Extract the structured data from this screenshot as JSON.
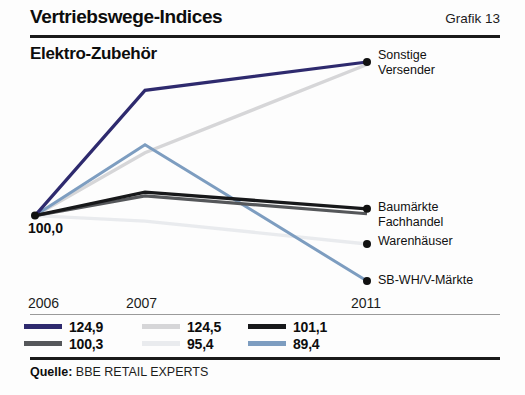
{
  "header": {
    "title": "Vertriebswege-Indices",
    "figure_number": "Grafik 13",
    "subtitle": "Elektro-Zubehör"
  },
  "footer": {
    "source_label": "Quelle:",
    "source_value": "BBE RETAIL EXPERTS"
  },
  "baseline_label": "100,0",
  "series_labels": {
    "sonstige_line1": "Sonstige",
    "sonstige_line2": "Versender",
    "baumaerkte": "Baumärkte",
    "fachhandel": "Fachhandel",
    "warenhaeuser": "Warenhäuser",
    "sbwh": "SB-WH/V-Märkte"
  },
  "legend": [
    {
      "value": "124,9",
      "color": "#2e2a6e"
    },
    {
      "value": "124,5",
      "color": "#d6d6d8"
    },
    {
      "value": "101,1",
      "color": "#17181a"
    },
    {
      "value": "100,3",
      "color": "#55575a"
    },
    {
      "value": "95,4",
      "color": "#e9ebee"
    },
    {
      "value": "89,4",
      "color": "#7d9dc0"
    }
  ],
  "chart_data": {
    "type": "line",
    "title": "Vertriebswege-Indices",
    "subtitle": "Elektro-Zubehör",
    "xlabel": "",
    "ylabel": "Index (2006 = 100,0)",
    "x": [
      "2006",
      "2007",
      "2011"
    ],
    "tick_labels": [
      "2006",
      "2007",
      "2011"
    ],
    "base_value": 100.0,
    "grid": false,
    "legend_position": "bottom",
    "ylim": [
      85,
      130
    ],
    "series": [
      {
        "name": "Sonstige Versender",
        "color": "#2e2a6e",
        "values": [
          100.0,
          120.3,
          124.9
        ],
        "final_value": "124,9",
        "label_lines": [
          "Sonstige",
          "Versender"
        ]
      },
      {
        "name": "Fachhandel",
        "color": "#d6d6d8",
        "values": [
          100.0,
          110.2,
          124.5
        ],
        "final_value": "124,5",
        "label_lines": [
          "Fachhandel"
        ]
      },
      {
        "name": "Baumärkte",
        "color": "#17181a",
        "values": [
          100.0,
          103.8,
          101.1
        ],
        "final_value": "101,1",
        "label_lines": [
          "Baumärkte"
        ]
      },
      {
        "name": "Baumärkte/Fachhandel (dunkelgrau)",
        "color": "#55575a",
        "values": [
          100.0,
          103.2,
          100.3
        ],
        "final_value": "100,3",
        "label_lines": []
      },
      {
        "name": "Warenhäuser",
        "color": "#e9ebee",
        "values": [
          100.0,
          99.1,
          95.4
        ],
        "final_value": "95,4",
        "label_lines": [
          "Warenhäuser"
        ]
      },
      {
        "name": "SB-WH/V-Märkte",
        "color": "#7d9dc0",
        "values": [
          100.0,
          111.5,
          89.4
        ],
        "final_value": "89,4",
        "label_lines": [
          "SB-WH/V-Märkte"
        ]
      }
    ]
  }
}
